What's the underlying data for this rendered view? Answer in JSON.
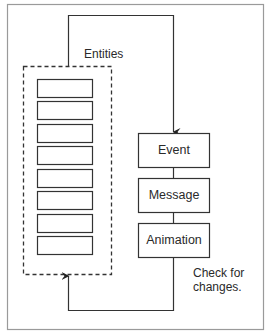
{
  "diagram": {
    "group_label": "Entities",
    "entity_count": 8,
    "pipeline": [
      {
        "label": "Event"
      },
      {
        "label": "Message"
      },
      {
        "label": "Animation"
      }
    ],
    "loop_note_line1": "Check for",
    "loop_note_line2": "changes.",
    "colors": {
      "frame": "#999999",
      "stroke": "#333333",
      "background": "#ffffff"
    }
  }
}
